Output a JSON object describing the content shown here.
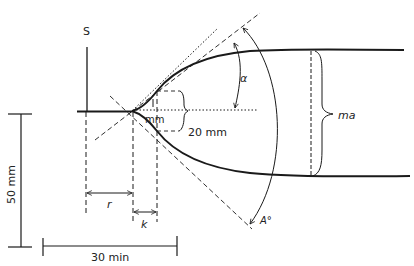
{
  "diagram": {
    "colors": {
      "ink": "#1a1a1a",
      "background": "#ffffff"
    },
    "labels": {
      "s": "S",
      "mm": "mm",
      "twenty_mm": "20 mm",
      "ma": "ma",
      "alpha": "α",
      "a_degree": "A°",
      "r": "r",
      "k": "k",
      "fifty_mm": "50 mm",
      "thirty_min": "30 min"
    }
  }
}
